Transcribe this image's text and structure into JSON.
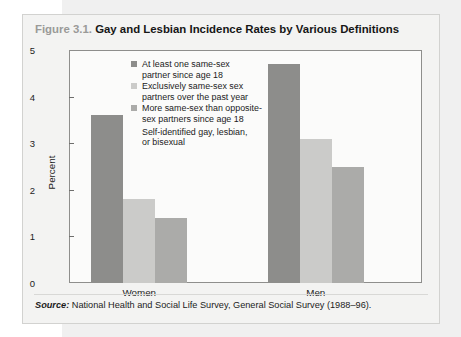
{
  "figure": {
    "number": "Figure 3.1.",
    "title": "Gay and Lesbian Incidence Rates by Various Definitions",
    "source_word": "Source:",
    "source_text": "National Health and Social Life Survey, General Social Survey (1988–96)."
  },
  "colors": {
    "series_1": "#8d8d8b",
    "series_2": "#cbcbc9",
    "series_3": "#ababa9",
    "frame": "#8e8e8c",
    "panel": "#f3f3f2",
    "plot_bg": "#fbfbfa",
    "text": "#1b1b1b",
    "fig_num": "#9a9a98"
  },
  "chart_data": {
    "type": "bar",
    "title": "Gay and Lesbian Incidence Rates by Various Definitions",
    "xlabel": "",
    "ylabel": "Percent",
    "ylim": [
      0,
      5
    ],
    "yticks": [
      "0",
      "1",
      "2",
      "3",
      "4",
      "5"
    ],
    "grid": false,
    "legend_position": "inside-top-center",
    "categories": [
      "Women",
      "Men"
    ],
    "series": [
      {
        "name": "At least one same-sex partner since age 18",
        "color": "#8d8d8b",
        "values": [
          3.6,
          4.7
        ]
      },
      {
        "name": "Exclusively same-sex sex partners over the past year",
        "color": "#cbcbc9",
        "values": [
          1.8,
          3.1
        ]
      },
      {
        "name": "More same-sex than opposite-sex partners since age 18",
        "color": "#ababa9",
        "values": [
          1.4,
          2.5
        ]
      }
    ],
    "legend_note": "Self-identified gay, lesbian, or bisexual",
    "annotations": [],
    "source": "Source: National Health and Social Life Survey, General Social Survey (1988–96)."
  },
  "legend": {
    "items": [
      {
        "label_line_1": "At least one same-sex",
        "label_line_2": "partner since age 18",
        "swatch": "#8d8d8b"
      },
      {
        "label_line_1": "Exclusively same-sex sex",
        "label_line_2": "partners over the past year",
        "swatch": "#cbcbc9"
      },
      {
        "label_line_1": "More same-sex than opposite-",
        "label_line_2": "sex partners since age 18",
        "swatch": "#ababa9"
      }
    ],
    "note_line_1": "Self-identified gay, lesbian,",
    "note_line_2": "or bisexual"
  }
}
